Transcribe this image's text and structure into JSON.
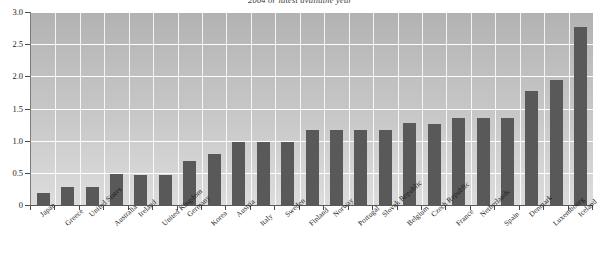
{
  "chart_data": {
    "type": "bar",
    "title": "2004 or latest available year",
    "xlabel": "",
    "ylabel": "",
    "ylim": [
      0,
      3.0
    ],
    "ytick_labels": [
      "0",
      "0.5",
      "1.0",
      "1.5",
      "2.0",
      "2.5",
      "3.0"
    ],
    "ytick_values": [
      0,
      0.5,
      1.0,
      1.5,
      2.0,
      2.5,
      3.0
    ],
    "grid": true,
    "legend": "none",
    "bar_color": "#595959",
    "plot_background_top": "#b2b2b2",
    "plot_background_bottom": "#dcdcdc",
    "gridline_color": "#ffffff",
    "categories": [
      "Japan",
      "Greece",
      "United States",
      "Australia",
      "Ireland",
      "United Kingdom",
      "Germany",
      "Korea",
      "Austria",
      "Italy",
      "Sweden",
      "Finland",
      "Norway",
      "Portugal",
      "Slovak Republic",
      "Belgium",
      "Czech Republic",
      "France",
      "Netherlands",
      "Spain",
      "Denmark",
      "Luxembourg",
      "Iceland"
    ],
    "values": [
      0.18,
      0.28,
      0.28,
      0.48,
      0.47,
      0.47,
      0.68,
      0.79,
      0.98,
      0.98,
      0.98,
      1.17,
      1.17,
      1.17,
      1.17,
      1.27,
      1.26,
      1.36,
      1.36,
      1.35,
      1.78,
      1.95,
      2.77
    ]
  }
}
